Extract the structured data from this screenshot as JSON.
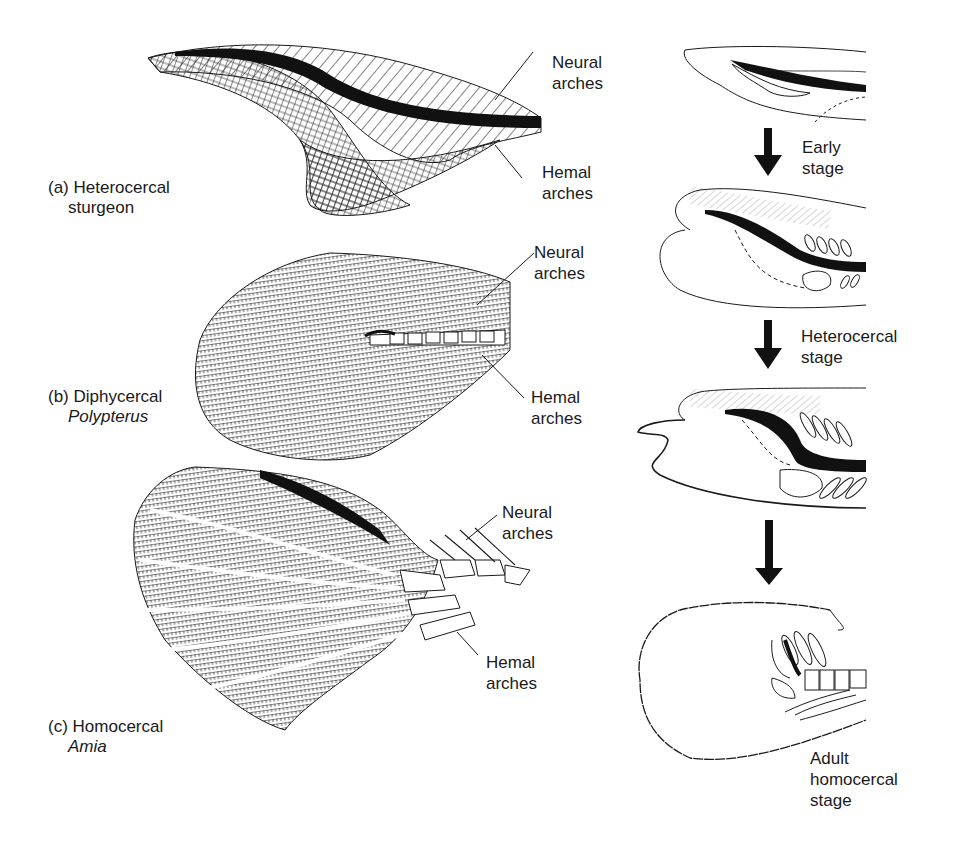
{
  "figure": {
    "left_column": {
      "panels": [
        {
          "id": "a",
          "caption_line1": "(a) Heterocercal",
          "caption_line2": "sturgeon",
          "caption_line2_italic": false,
          "callouts": {
            "neural_line1": "Neural",
            "neural_line2": "arches",
            "hemal_line1": "Hemal",
            "hemal_line2": "arches"
          }
        },
        {
          "id": "b",
          "caption_line1": "(b) Diphycercal",
          "caption_line2": "Polypterus",
          "caption_line2_italic": true,
          "callouts": {
            "neural_line1": "Neural",
            "neural_line2": "arches",
            "hemal_line1": "Hemal",
            "hemal_line2": "arches"
          }
        },
        {
          "id": "c",
          "caption_line1": "(c) Homocercal",
          "caption_line2": "Amia",
          "caption_line2_italic": true,
          "callouts": {
            "neural_line1": "Neural",
            "neural_line2": "arches",
            "hemal_line1": "Hemal",
            "hemal_line2": "arches"
          }
        }
      ]
    },
    "right_column": {
      "title": "Developmental sequence",
      "stages": [
        {
          "arrow_label_line1": "Early",
          "arrow_label_line2": "stage"
        },
        {
          "arrow_label_line1": "Heterocercal",
          "arrow_label_line2": "stage"
        },
        {
          "arrow_label_line1": "",
          "arrow_label_line2": ""
        }
      ],
      "final_label_line1": "Adult",
      "final_label_line2": "homocercal",
      "final_label_line3": "stage"
    },
    "colors": {
      "ink": "#1a1a1a",
      "background": "#ffffff"
    }
  }
}
